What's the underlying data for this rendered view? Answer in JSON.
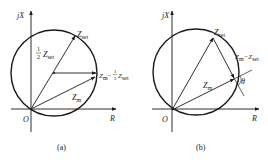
{
  "figures": [
    {
      "id": "a",
      "caption": "(a)",
      "axes": {
        "y_label": "jX",
        "x_label": "R",
        "origin_label": "O"
      },
      "labels": {
        "z_set": "Z",
        "z_set_sub": "set",
        "half_frac_num": "1",
        "half_frac_den": "2",
        "half_z": "Z",
        "half_z_sub": "set",
        "diff_z": "Z",
        "diff_z_sub": "m",
        "diff_minus": "−",
        "diff_frac_num": "1",
        "diff_frac_den": "2",
        "diff_z2": "Z",
        "diff_z2_sub": "set",
        "z_m": "Z",
        "z_m_sub": "m"
      }
    },
    {
      "id": "b",
      "caption": "(b)",
      "axes": {
        "y_label": "jX",
        "x_label": "R",
        "origin_label": "O"
      },
      "labels": {
        "z_set": "Z",
        "z_set_sub": "set",
        "diff": "Z",
        "diff_sub": "m",
        "diff_minus": "−Z",
        "diff_sub2": "set",
        "z_m": "Z",
        "z_m_sub": "m",
        "theta": "θ"
      }
    }
  ],
  "colors": {
    "stroke": "#1a1a1a",
    "background": "#ffffff"
  }
}
